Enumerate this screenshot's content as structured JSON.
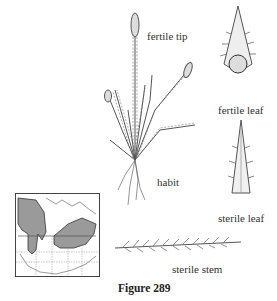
{
  "labels": {
    "fertile_tip": "fertile tip",
    "fertile_leaf": "fertile leaf",
    "habit": "habit",
    "sterile_leaf": "sterile leaf",
    "sterile_stem": "sterile stem"
  },
  "caption": "Figure 289"
}
